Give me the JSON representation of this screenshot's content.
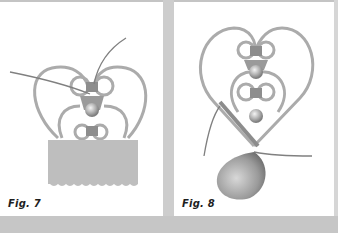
{
  "figures": [
    {
      "id": "fig7",
      "caption": "Fig. 7",
      "description": "Heart-shaped wire/bead frame with crossing thread, bead cluster at center, and rectangular fabric piece with scalloped lower edge attached at bottom"
    },
    {
      "id": "fig8",
      "caption": "Fig. 8",
      "description": "Heart-shaped wire/bead frame with two stacked bead clusters, thread wrapping down to a teardrop pendant bead at the bottom"
    }
  ],
  "colors": {
    "background": "#c9c9c9",
    "panel": "#ffffff",
    "wire": "#a9a9a9",
    "thread": "#7a7a7a",
    "fabric": "#bdbdbd",
    "bead_dark": "#8a8a8a",
    "bead_light": "#e6e6e6",
    "caption": "#1e1e1e"
  }
}
